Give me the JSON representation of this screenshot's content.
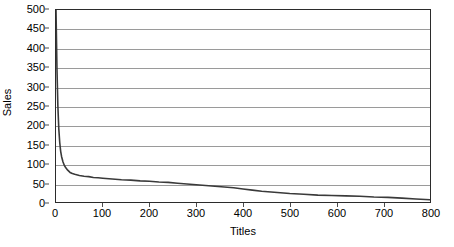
{
  "chart_data": {
    "type": "line",
    "title": "",
    "subtitle": "",
    "xlabel": "Titles",
    "ylabel": "Sales",
    "xlim": [
      0,
      800
    ],
    "ylim": [
      0,
      500
    ],
    "xticks": [
      0,
      100,
      200,
      300,
      400,
      500,
      600,
      700,
      800
    ],
    "yticks": [
      0,
      50,
      100,
      150,
      200,
      250,
      300,
      350,
      400,
      450,
      500
    ],
    "grid": "horizontal",
    "legend": "none",
    "series_color": "#3a3a3a",
    "grid_color": "#9a9a9a",
    "axis_color": "#2b2b2b",
    "series": [
      {
        "name": "Sales by title rank",
        "x": [
          0,
          2,
          4,
          6,
          8,
          10,
          12,
          15,
          18,
          21,
          25,
          30,
          35,
          40,
          50,
          60,
          70,
          80,
          90,
          100,
          120,
          140,
          160,
          180,
          200,
          220,
          240,
          260,
          280,
          300,
          320,
          340,
          360,
          380,
          400,
          420,
          440,
          460,
          480,
          500,
          530,
          560,
          590,
          620,
          650,
          680,
          710,
          740,
          770,
          800
        ],
        "values": [
          500,
          350,
          250,
          190,
          155,
          132,
          118,
          104,
          95,
          89,
          83,
          77,
          74,
          72,
          69,
          67,
          66,
          64,
          63,
          62,
          60,
          58,
          57,
          55,
          54,
          52,
          51,
          49,
          47,
          45,
          43,
          41,
          39,
          37,
          34,
          31,
          28,
          26,
          24,
          22,
          20,
          18,
          17,
          16,
          15,
          13,
          12,
          10,
          8,
          6
        ]
      }
    ]
  }
}
